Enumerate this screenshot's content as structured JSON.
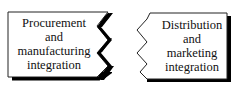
{
  "diagram": {
    "type": "two-panel integration diagram",
    "left_box": {
      "lines": [
        "Procurement",
        "and",
        "manufacturing",
        "integration"
      ]
    },
    "right_box": {
      "lines": [
        "Distribution",
        "and",
        "marketing",
        "integration"
      ]
    },
    "colors": {
      "background": "#ffffff",
      "box_fill": "#ffffff",
      "stroke": "#222222",
      "shadow": "#000000",
      "text": "#111111"
    }
  }
}
